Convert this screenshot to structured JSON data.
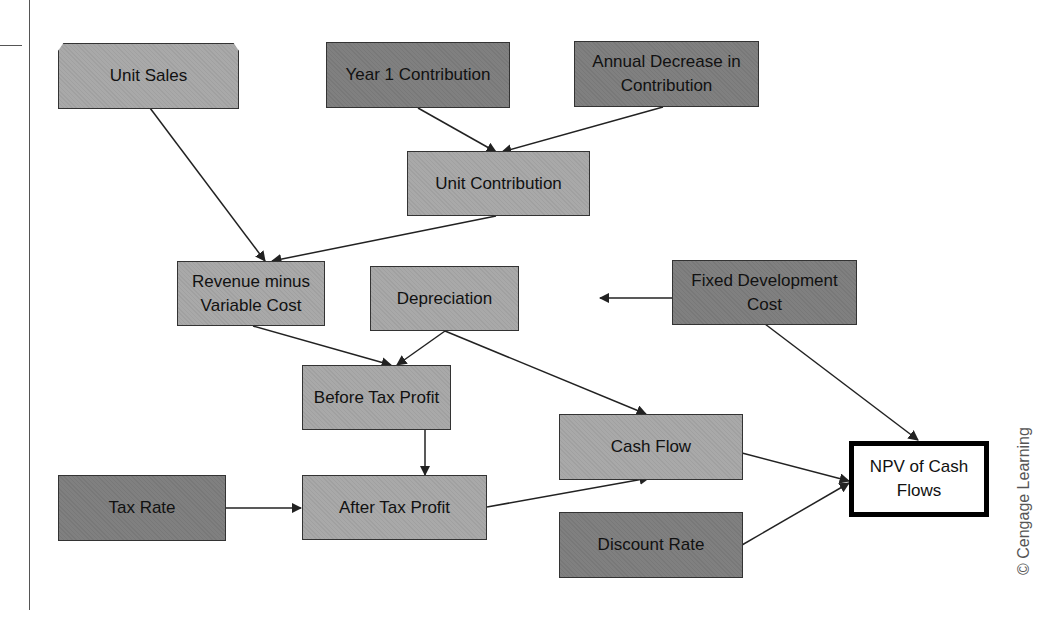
{
  "diagram": {
    "type": "influence-diagram",
    "colors": {
      "input_node": "#808080",
      "calc_node": "#a9a9a9",
      "output_node": "#ffffff",
      "edge": "#222222"
    },
    "nodes": [
      {
        "id": "unit_sales",
        "label": "Unit Sales",
        "kind": "calc"
      },
      {
        "id": "year1_contribution",
        "label": "Year 1 Contribution",
        "kind": "input"
      },
      {
        "id": "annual_decrease",
        "label": "Annual Decrease in Contribution",
        "kind": "input"
      },
      {
        "id": "unit_contribution",
        "label": "Unit Contribution",
        "kind": "calc"
      },
      {
        "id": "revenue_minus_vc",
        "label": "Revenue minus Variable Cost",
        "kind": "calc"
      },
      {
        "id": "depreciation",
        "label": "Depreciation",
        "kind": "calc"
      },
      {
        "id": "fixed_dev_cost",
        "label": "Fixed Development Cost",
        "kind": "input"
      },
      {
        "id": "before_tax_profit",
        "label": "Before Tax Profit",
        "kind": "calc"
      },
      {
        "id": "cash_flow",
        "label": "Cash Flow",
        "kind": "calc"
      },
      {
        "id": "tax_rate",
        "label": "Tax Rate",
        "kind": "input"
      },
      {
        "id": "after_tax_profit",
        "label": "After Tax Profit",
        "kind": "calc"
      },
      {
        "id": "discount_rate",
        "label": "Discount Rate",
        "kind": "input"
      },
      {
        "id": "npv",
        "label": "NPV of Cash Flows",
        "kind": "output"
      }
    ],
    "edges": [
      [
        "year1_contribution",
        "unit_contribution"
      ],
      [
        "annual_decrease",
        "unit_contribution"
      ],
      [
        "unit_sales",
        "revenue_minus_vc"
      ],
      [
        "unit_contribution",
        "revenue_minus_vc"
      ],
      [
        "fixed_dev_cost",
        "depreciation"
      ],
      [
        "revenue_minus_vc",
        "before_tax_profit"
      ],
      [
        "depreciation",
        "before_tax_profit"
      ],
      [
        "depreciation",
        "cash_flow"
      ],
      [
        "before_tax_profit",
        "after_tax_profit"
      ],
      [
        "tax_rate",
        "after_tax_profit"
      ],
      [
        "after_tax_profit",
        "cash_flow"
      ],
      [
        "cash_flow",
        "npv"
      ],
      [
        "discount_rate",
        "npv"
      ],
      [
        "fixed_dev_cost",
        "npv"
      ]
    ],
    "labels": {
      "unit_sales": "Unit Sales",
      "year1_contribution": "Year 1 Contribution",
      "annual_decrease_l1": "Annual Decrease in",
      "annual_decrease_l2": "Contribution",
      "unit_contribution": "Unit Contribution",
      "revenue_l1": "Revenue minus",
      "revenue_l2": "Variable Cost",
      "depreciation": "Depreciation",
      "fixed_dev_l1": "Fixed Development",
      "fixed_dev_l2": "Cost",
      "before_tax_profit": "Before Tax Profit",
      "cash_flow": "Cash Flow",
      "tax_rate": "Tax Rate",
      "after_tax_profit": "After Tax Profit",
      "discount_rate": "Discount Rate",
      "npv_l1": "NPV of Cash",
      "npv_l2": "Flows"
    },
    "credit": "© Cengage Learning"
  }
}
